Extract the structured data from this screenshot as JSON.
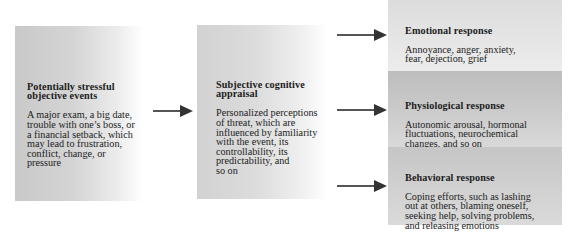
{
  "diagram": {
    "type": "flow",
    "stressor": {
      "title": "Potentially stressful\nobjective events",
      "description": "A major exam, a big date,\ntrouble with one’s boss, or\na financial setback, which\nmay lead to frustration,\nconflict, change, or\npressure"
    },
    "appraisal": {
      "title": "Subjective cognitive\nappraisal",
      "description": "Personalized perceptions\nof threat, which are\ninfluenced by familiarity\nwith the event, its\ncontrollability, its\npredictability, and\nso on"
    },
    "responses": [
      {
        "title": "Emotional response",
        "description": "Annoyance, anger, anxiety,\nfear, dejection, grief"
      },
      {
        "title": "Physiological response",
        "description": "Autonomic arousal, hormonal\nfluctuations, neurochemical\nchanges, and so on"
      },
      {
        "title": "Behavioral response",
        "description": "Coping efforts, such as lashing\nout at others, blaming oneself,\nseeking help, solving problems,\nand releasing emotions"
      }
    ],
    "edges": [
      {
        "from": "stressor",
        "to": "appraisal"
      },
      {
        "from": "appraisal",
        "to": "responses.0"
      },
      {
        "from": "appraisal",
        "to": "responses.1"
      },
      {
        "from": "appraisal",
        "to": "responses.2"
      }
    ]
  }
}
